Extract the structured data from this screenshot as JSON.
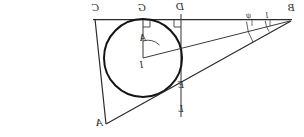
{
  "figure": {
    "kind": "geometry-diagram",
    "ink_color": "#2b2b2b",
    "background_color": "#ffffff",
    "stroke_widths": {
      "circle": 1.9,
      "line": 1.0,
      "thin": 0.8
    }
  },
  "labels": {
    "C": {
      "text": "C",
      "x": 92,
      "y": 3,
      "size": "big"
    },
    "G": {
      "text": "G",
      "x": 138,
      "y": 3,
      "size": "big"
    },
    "D": {
      "text": "D",
      "x": 178,
      "y": 2,
      "size": "big"
    },
    "B": {
      "text": "B",
      "x": 288,
      "y": 3,
      "size": "big"
    },
    "I": {
      "text": "I",
      "x": 138,
      "y": 60,
      "size": "mid"
    },
    "alpha": {
      "text": "A",
      "x": 145,
      "y": 38,
      "size": "mid"
    },
    "E": {
      "text": "E",
      "x": 180,
      "y": 80,
      "size": "mid"
    },
    "L": {
      "text": "L",
      "x": 178,
      "y": 104,
      "size": "mid"
    },
    "A": {
      "text": "A",
      "x": 95,
      "y": 118,
      "size": "big"
    },
    "psi": {
      "text": "ψ",
      "x": 247,
      "y": 14,
      "size": "sm"
    },
    "phi": {
      "text": "1",
      "x": 266,
      "y": 13,
      "size": "sm"
    }
  },
  "points": {
    "C": {
      "x": 96,
      "y": 19
    },
    "G": {
      "x": 143,
      "y": 19
    },
    "D": {
      "x": 181,
      "y": 19
    },
    "B": {
      "x": 288,
      "y": 19
    },
    "I": {
      "x": 143,
      "y": 58
    },
    "E": {
      "x": 176,
      "y": 86
    },
    "L": {
      "x": 181,
      "y": 112
    },
    "A": {
      "x": 106,
      "y": 122
    }
  },
  "circle": {
    "cx": 143,
    "cy": 58,
    "r": 39
  },
  "segments": [
    {
      "name": "top-line-C-B",
      "x1": 93,
      "y1": 19,
      "x2": 292,
      "y2": 19
    },
    {
      "name": "vertical-D-L",
      "x1": 181,
      "y1": 15,
      "x2": 181,
      "y2": 116
    },
    {
      "name": "radius-I-G",
      "x1": 143,
      "y1": 58,
      "x2": 143,
      "y2": 19
    },
    {
      "name": "line-I-B",
      "x1": 143,
      "y1": 58,
      "x2": 290,
      "y2": 21
    },
    {
      "name": "line-A-B",
      "x1": 106,
      "y1": 124,
      "x2": 291,
      "y2": 21
    },
    {
      "name": "line-C-A",
      "x1": 95,
      "y1": 19,
      "x2": 106,
      "y2": 124
    }
  ],
  "right_angle_marks": [
    {
      "name": "right-angle-at-G",
      "x": 143,
      "y": 19
    },
    {
      "name": "right-angle-at-D",
      "x": 181,
      "y": 19
    }
  ],
  "angle_arcs": [
    {
      "name": "angle-alpha-at-I",
      "cx": 143,
      "cy": 58,
      "r": 17,
      "start_deg": -90,
      "end_deg": -14
    },
    {
      "name": "angle-psi-at-B",
      "cx": 288,
      "cy": 19,
      "r": 42,
      "label": "ψ"
    },
    {
      "name": "angle-phi-at-B",
      "cx": 288,
      "cy": 19,
      "r": 23,
      "label": "1"
    }
  ]
}
